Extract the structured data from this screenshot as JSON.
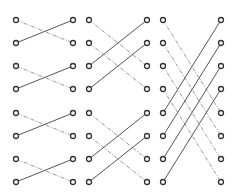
{
  "diagram": {
    "type": "butterfly-network",
    "colors": {
      "background": "#ffffff",
      "node_stroke": "#333333",
      "solid_edge": "#555555",
      "dashed_edge": "#9a9a9a"
    },
    "rows_y": [
      20,
      43,
      66,
      89,
      113,
      136,
      159,
      182
    ],
    "node_radius": 2.5,
    "stages": [
      {
        "name": "stage-1",
        "left_x": 16,
        "right_x": 73,
        "span": 1
      },
      {
        "name": "stage-2",
        "left_x": 89,
        "right_x": 147,
        "span": 2
      },
      {
        "name": "stage-3",
        "left_x": 163,
        "right_x": 221,
        "span": 4
      }
    ],
    "edge_legend": {
      "dashed": "connection to row index + span (downward)",
      "solid": "connection to row index - span (upward)"
    }
  }
}
